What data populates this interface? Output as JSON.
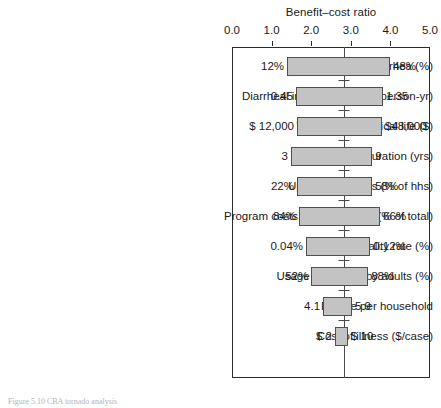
{
  "chart_data": {
    "type": "bar",
    "subtype": "tornado",
    "title": "Benefit–cost ratio",
    "xlabel": "Benefit–cost ratio",
    "ylabel": "",
    "xlim": [
      0.0,
      5.0
    ],
    "xticks": [
      "0.0",
      "1.0",
      "2.0",
      "3.0",
      "4.0",
      "5.0"
    ],
    "xtick_values": [
      0.0,
      1.0,
      2.0,
      3.0,
      4.0,
      5.0
    ],
    "grid": false,
    "legend": "none",
    "baseline_value": 2.83,
    "categories": [
      "Reduction in diarrhea (%)",
      "Diarrheal incidence (cases/person-yr)",
      "Value of a statistical life ($)",
      "Project duration (yrs)",
      "Uptake of latrines (% of hhs)",
      "Program costs per household (% of total)",
      "Case fatality rate (%)",
      "Usage of latrines by adults (%)",
      "People per household",
      "Cost of illness ($/case)"
    ],
    "bars": [
      {
        "label": "Reduction in diarrhea (%)",
        "low_value": 1.39,
        "high_value": 3.99,
        "low_label": "12%",
        "high_label": "48%"
      },
      {
        "label": "Diarrheal incidence (cases/person-yr)",
        "low_value": 1.62,
        "high_value": 3.81,
        "low_label": "0.45",
        "high_label": "1.35"
      },
      {
        "label": "Value of a statistical life ($)",
        "low_value": 1.64,
        "high_value": 3.79,
        "low_label": "$ 12,000",
        "high_label": "$48,000"
      },
      {
        "label": "Project duration (yrs)",
        "low_value": 1.49,
        "high_value": 3.54,
        "low_label": "3",
        "high_label": "9"
      },
      {
        "label": "Uptake of latrines (% of hhs)",
        "low_value": 1.64,
        "high_value": 3.54,
        "low_label": "22%",
        "high_label": "58%"
      },
      {
        "label": "Program costs per household (% of total)",
        "low_value": 1.69,
        "high_value": 3.74,
        "low_label": "84%",
        "high_label": "66%"
      },
      {
        "label": "Case fatality rate (%)",
        "low_value": 1.87,
        "high_value": 3.49,
        "low_label": "0.04%",
        "high_label": "0.12%"
      },
      {
        "label": "Usage of latrines by adults (%)",
        "low_value": 2.0,
        "high_value": 3.44,
        "low_label": "52%",
        "high_label": "88%"
      },
      {
        "label": "People per household",
        "low_value": 2.3,
        "high_value": 3.03,
        "low_label": "4.1",
        "high_label": "5.9"
      },
      {
        "label": "Cost of illness ($/case)",
        "low_value": 2.6,
        "high_value": 2.93,
        "low_label": "$          2",
        "high_label": "$      10"
      }
    ]
  },
  "caption": {
    "text": "Figure 5.10  CBA tornado analysis"
  }
}
